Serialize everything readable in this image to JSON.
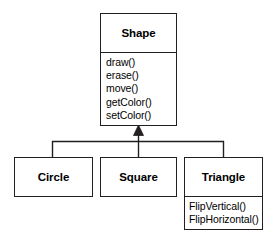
{
  "diagram": {
    "type": "uml-class-diagram",
    "title": "",
    "background_color": "#ffffff",
    "line_color": "#231f20",
    "text_color": "#000000",
    "relationship": {
      "kind": "generalization",
      "arrow": "hollow-triangle-filled",
      "direction": "subclasses-to-superclass",
      "superclass": "Shape",
      "subclasses": [
        "Circle",
        "Square",
        "Triangle"
      ]
    },
    "classes": {
      "shape": {
        "name": "Shape",
        "operations": [
          "draw()",
          "erase()",
          "move()",
          "getColor()",
          "setColor()"
        ]
      },
      "circle": {
        "name": "Circle",
        "operations": []
      },
      "square": {
        "name": "Square",
        "operations": []
      },
      "triangle": {
        "name": "Triangle",
        "operations": [
          "FlipVertical()",
          "FlipHorizontal()"
        ]
      }
    }
  }
}
